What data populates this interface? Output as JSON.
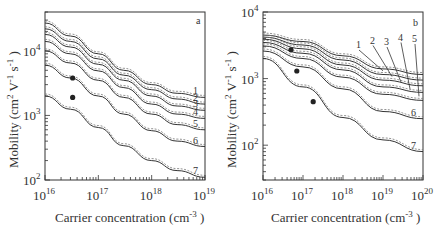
{
  "chart_data": [
    {
      "type": "line",
      "panel_label": "a",
      "xlabel": "Carrier concentration (cm^-3)",
      "ylabel": "Mobility (cm^2 V^-1 s^-1)",
      "xscale": "log",
      "yscale": "log",
      "xlim": [
        1e+16,
        1e+19
      ],
      "ylim": [
        100,
        40000
      ],
      "x_ticks": [
        "10^16",
        "10^17",
        "10^18",
        "10^19"
      ],
      "y_ticks": [
        "10^2",
        "10^3",
        "10^4"
      ],
      "grid": false,
      "x": [
        1e+16,
        3e+16,
        1e+17,
        3e+17,
        1e+18,
        3e+18,
        1e+19
      ],
      "series": [
        {
          "name": "1",
          "values": [
            27000,
            17000,
            9000,
            5000,
            3000,
            2200,
            1900
          ]
        },
        {
          "name": "2",
          "values": [
            22000,
            14000,
            7500,
            4200,
            2500,
            1800,
            1500
          ]
        },
        {
          "name": "3",
          "values": [
            18000,
            11500,
            6200,
            3500,
            2000,
            1400,
            1200
          ]
        },
        {
          "name": "4",
          "values": [
            14000,
            9000,
            4900,
            2700,
            1500,
            1050,
            900
          ]
        },
        {
          "name": "5",
          "values": [
            10000,
            6500,
            3500,
            1900,
            1050,
            720,
            600
          ]
        },
        {
          "name": "6",
          "values": [
            6000,
            3800,
            2000,
            1050,
            580,
            400,
            330
          ]
        },
        {
          "name": "7",
          "values": [
            2000,
            1250,
            650,
            340,
            200,
            140,
            110
          ]
        }
      ],
      "markers": [
        {
          "x": 3.3e+16,
          "y": 3800
        },
        {
          "x": 3.3e+16,
          "y": 1900
        }
      ]
    },
    {
      "type": "line",
      "panel_label": "b",
      "xlabel": "Carrier concentration (cm^-3)",
      "ylabel": "Mobility (cm^2 V^-1 s^-1)",
      "xscale": "log",
      "yscale": "log",
      "xlim": [
        1e+16,
        1e+20
      ],
      "ylim": [
        30,
        10000
      ],
      "x_ticks": [
        "10^16",
        "10^17",
        "10^18",
        "10^19",
        "10^20"
      ],
      "y_ticks": [
        "10^2",
        "10^3",
        "10^4"
      ],
      "grid": false,
      "x": [
        1e+16,
        1e+17,
        1e+18,
        1e+19,
        1e+20
      ],
      "series": [
        {
          "name": "1",
          "values": [
            4500,
            3600,
            2200,
            1400,
            1150
          ]
        },
        {
          "name": "2",
          "values": [
            4200,
            3200,
            1900,
            1150,
            950
          ]
        },
        {
          "name": "3",
          "values": [
            3900,
            2800,
            1600,
            950,
            780
          ]
        },
        {
          "name": "4",
          "values": [
            3500,
            2400,
            1350,
            750,
            620
          ]
        },
        {
          "name": "5",
          "values": [
            3100,
            2000,
            1050,
            580,
            470
          ]
        },
        {
          "name": "6",
          "values": [
            2600,
            1500,
            700,
            320,
            250
          ]
        },
        {
          "name": "7",
          "values": [
            2000,
            750,
            260,
            120,
            80
          ]
        }
      ],
      "markers": [
        {
          "x": 5e+16,
          "y": 2700
        },
        {
          "x": 7e+16,
          "y": 1300
        },
        {
          "x": 1.8e+17,
          "y": 450
        }
      ]
    }
  ],
  "panel_a": {
    "label": "a",
    "x_ticks": [
      "16",
      "17",
      "18",
      "19"
    ],
    "y_ticks": [
      "2",
      "3",
      "4"
    ],
    "curve_labels": [
      "1",
      "2",
      "3",
      "4",
      "5",
      "6",
      "7"
    ],
    "xlabel": "Carrier concentration (cm",
    "xlabel_sup": "-3",
    "ylabel": "Mobility (cm",
    "base": "10"
  },
  "panel_b": {
    "label": "b",
    "x_ticks": [
      "16",
      "17",
      "18",
      "19",
      "20"
    ],
    "y_ticks": [
      "2",
      "3",
      "4"
    ],
    "curve_labels": [
      "1",
      "2",
      "3",
      "4",
      "5",
      "6",
      "7"
    ],
    "xlabel": "Carrier concentration (cm",
    "xlabel_sup": "-3",
    "ylabel": "Mobility (cm",
    "base": "10"
  }
}
